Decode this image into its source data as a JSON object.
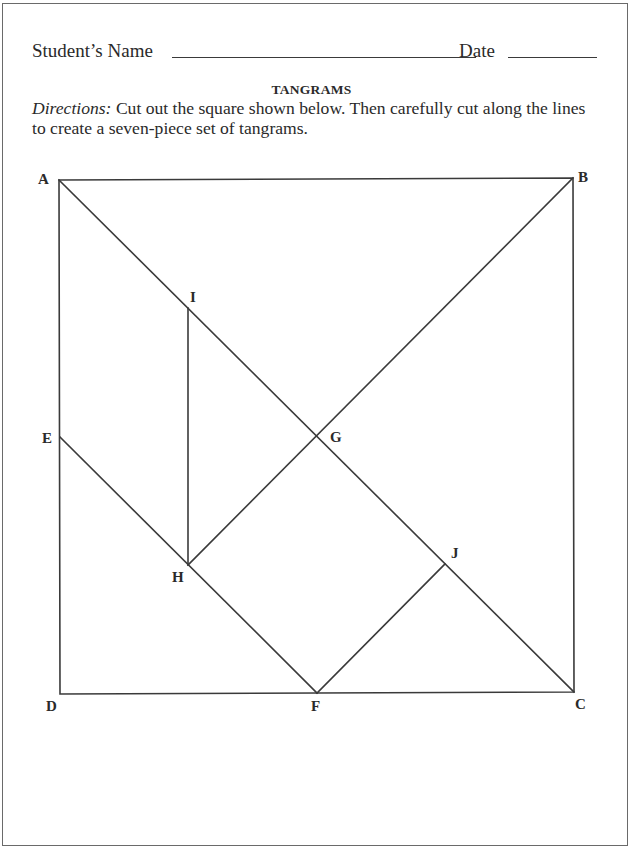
{
  "worksheet": {
    "name_label": "Student’s Name",
    "date_label": "Date",
    "title": "TANGRAMS",
    "directions_label": "Directions:",
    "directions_text": " Cut out the square shown below. Then carefully cut along the lines to create a seven-piece set of tangrams."
  },
  "diagram": {
    "points": {
      "A": "A",
      "B": "B",
      "C": "C",
      "D": "D",
      "E": "E",
      "F": "F",
      "G": "G",
      "H": "H",
      "I": "I",
      "J": "J"
    },
    "segments": [
      "AB",
      "BC",
      "CD",
      "DA",
      "AC",
      "BH",
      "EF",
      "IH",
      "FJ"
    ],
    "pieces": 7
  }
}
